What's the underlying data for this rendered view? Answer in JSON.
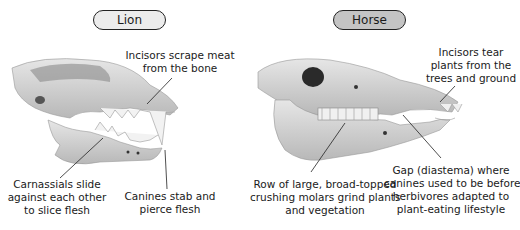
{
  "lion": {
    "title": "Lion",
    "labels": {
      "incisors": [
        "Incisors scrape meat",
        "from the bone"
      ],
      "carnassials": [
        "Carnassials slide",
        "against each other",
        "to slice flesh"
      ],
      "canines": [
        "Canines stab and",
        "pierce flesh"
      ]
    }
  },
  "horse": {
    "title": "Horse",
    "labels": {
      "incisors": [
        "Incisors tear",
        "plants from the",
        "trees and ground"
      ],
      "molars": [
        "Row of large, broad-topped",
        "crushing molars grind plants",
        "and vegetation"
      ],
      "gap": [
        "Gap (diastema) where",
        "canines used to be before",
        "herbivores adapted to",
        "plant-eating lifestyle"
      ]
    }
  },
  "colors": {
    "lion_pill": "#ececec",
    "horse_pill": "#c4c4c4",
    "outline": "#222222",
    "bone": "#d9d9d9"
  }
}
